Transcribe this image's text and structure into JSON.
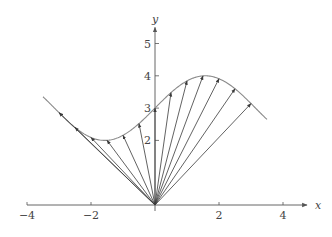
{
  "diagram": {
    "type": "vector-field-position-vectors",
    "curve": "y = 3 + sin(x)",
    "curve_x_range": [
      -3.5,
      3.5
    ],
    "vector_origin": [
      0,
      0
    ],
    "vector_x_values": [
      -3,
      -2.5,
      -2,
      -1.5,
      -1,
      -0.5,
      0,
      0.5,
      1,
      1.5,
      2,
      2.5,
      3
    ],
    "axes": {
      "x_label": "x",
      "y_label": "y",
      "x_ticks": [
        {
          "value": -4,
          "label": "−4"
        },
        {
          "value": -2,
          "label": "−2"
        },
        {
          "value": 0,
          "label": ""
        },
        {
          "value": 2,
          "label": "2"
        },
        {
          "value": 4,
          "label": "4"
        }
      ],
      "y_ticks": [
        {
          "value": 2,
          "label": "2"
        },
        {
          "value": 3,
          "label": "3"
        },
        {
          "value": 4,
          "label": "4"
        },
        {
          "value": 5,
          "label": "5"
        }
      ],
      "x_range": [
        -4,
        4.5
      ],
      "y_range": [
        0,
        5.5
      ]
    },
    "colors": {
      "axis": "#555555",
      "curve": "#8a8a8a",
      "vector": "#3a3a3a",
      "text": "#444444"
    },
    "layout": {
      "origin_px": [
        155,
        205
      ],
      "px_per_unit_x": 32,
      "px_per_unit_y": 32.3
    }
  }
}
